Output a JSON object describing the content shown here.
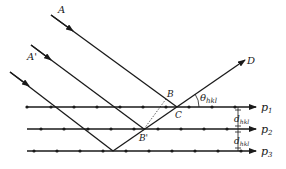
{
  "diagram": {
    "type": "bragg-diffraction",
    "labels": {
      "incident_ray_1": "A",
      "incident_ray_2": "A'",
      "reflected_ray": "D",
      "point_b": "B",
      "point_b_prime": "B'",
      "point_c": "C",
      "angle": "θ",
      "angle_sub": "hkl",
      "spacing_1": "d",
      "spacing_1_sub": "hkl",
      "spacing_2": "d",
      "spacing_2_sub": "hkl",
      "plane_1": "p",
      "plane_1_sub": "1",
      "plane_2": "p",
      "plane_2_sub": "2",
      "plane_3": "p",
      "plane_3_sub": "3"
    },
    "planes": [
      {
        "name": "p1",
        "y": 107,
        "atoms_x": [
          27,
          51,
          74,
          97,
          120,
          143,
          166,
          189,
          212,
          235,
          256
        ]
      },
      {
        "name": "p2",
        "y": 129,
        "atoms_x": [
          41,
          64,
          88,
          111,
          134,
          158,
          181,
          204,
          227
        ]
      },
      {
        "name": "p3",
        "y": 151,
        "atoms_x": [
          34,
          57,
          80,
          103,
          126,
          149,
          172,
          195,
          218,
          241
        ]
      }
    ],
    "colors": {
      "line": "#1a1a1a",
      "background": "#ffffff"
    }
  }
}
